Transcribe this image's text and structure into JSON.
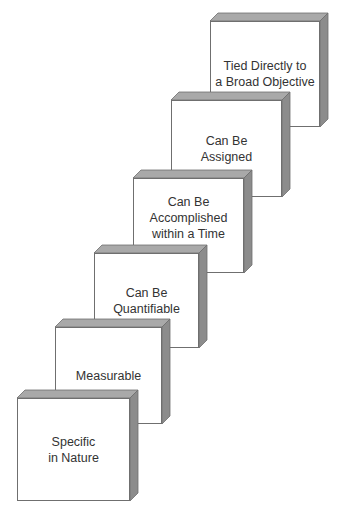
{
  "diagram": {
    "type": "staircase",
    "steps": [
      {
        "label": "Specific\nin Nature",
        "x": 17,
        "y": 398,
        "w": 113,
        "h": 103
      },
      {
        "label": "Measurable",
        "x": 55,
        "y": 327,
        "w": 107,
        "h": 97
      },
      {
        "label": "Can Be\nQuantifiable",
        "x": 94,
        "y": 253,
        "w": 105,
        "h": 95
      },
      {
        "label": "Can Be\nAccomplished\nwithin a Time Frame",
        "x": 133,
        "y": 178,
        "w": 111,
        "h": 95
      },
      {
        "label": "Can Be\nAssigned",
        "x": 171,
        "y": 100,
        "w": 111,
        "h": 97
      },
      {
        "label": "Tied Directly to\na Broad Objective",
        "x": 210,
        "y": 21,
        "w": 110,
        "h": 106
      }
    ],
    "colors": {
      "face": "#ffffff",
      "top": "#a9a9a9",
      "side": "#8c8c8c",
      "edge": "#6f6f6f"
    }
  }
}
